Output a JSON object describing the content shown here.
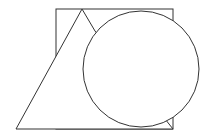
{
  "canvas": {
    "width": 210,
    "height": 137,
    "background": "#ffffff"
  },
  "style": {
    "stroke": "#333333",
    "stroke_width": 1,
    "fill": "#ffffff"
  },
  "shapes": {
    "square": {
      "x": 56,
      "y": 9,
      "width": 117,
      "height": 120
    },
    "triangle": {
      "points": "82,9 16,129 173,129 95,31"
    },
    "circle": {
      "cx": 141,
      "cy": 69,
      "r": 58
    }
  }
}
